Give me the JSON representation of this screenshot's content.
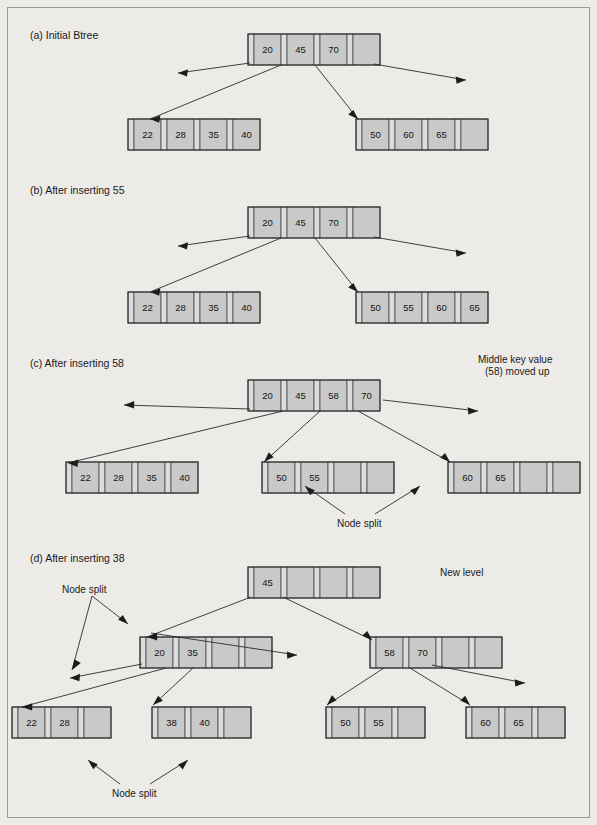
{
  "figure": {
    "title_label": "",
    "background_color": "#edebe8",
    "node_fill_color": "#c9c9c9",
    "pointer_fill_color": "#dcdcdc",
    "line_color": "#2b2b2b"
  },
  "panels": [
    {
      "id": "a",
      "label": "(a) Initial Btree",
      "root": {
        "keys": [
          "20",
          "45",
          "70"
        ],
        "capacity": 4
      },
      "leaves": [
        {
          "keys": [
            "22",
            "28",
            "35",
            "40"
          ],
          "capacity": 4
        },
        {
          "keys": [
            "50",
            "60",
            "65"
          ],
          "capacity": 4
        }
      ],
      "annotations": []
    },
    {
      "id": "b",
      "label": "(b) After inserting 55",
      "root": {
        "keys": [
          "20",
          "45",
          "70"
        ],
        "capacity": 4
      },
      "leaves": [
        {
          "keys": [
            "22",
            "28",
            "35",
            "40"
          ],
          "capacity": 4
        },
        {
          "keys": [
            "50",
            "55",
            "60",
            "65"
          ],
          "capacity": 4
        }
      ],
      "annotations": []
    },
    {
      "id": "c",
      "label": "(c) After inserting 58",
      "root": {
        "keys": [
          "20",
          "45",
          "58",
          "70"
        ],
        "capacity": 4
      },
      "leaves": [
        {
          "keys": [
            "22",
            "28",
            "35",
            "40"
          ],
          "capacity": 4
        },
        {
          "keys": [
            "50",
            "55"
          ],
          "capacity": 4
        },
        {
          "keys": [
            "60",
            "65"
          ],
          "capacity": 4
        }
      ],
      "annotations": [
        {
          "name": "middle-key-note",
          "lines": [
            "Middle key value",
            "(58) moved up"
          ]
        },
        {
          "name": "node-split-note",
          "lines": [
            "Node split"
          ]
        }
      ]
    },
    {
      "id": "d",
      "label": "(d) After inserting 38",
      "root": {
        "keys": [
          "45"
        ],
        "capacity": 4
      },
      "internal": [
        {
          "keys": [
            "20",
            "35"
          ],
          "capacity": 4
        },
        {
          "keys": [
            "58",
            "70"
          ],
          "capacity": 4
        }
      ],
      "leaves": [
        {
          "keys": [
            "22",
            "28"
          ],
          "capacity": 3
        },
        {
          "keys": [
            "38",
            "40"
          ],
          "capacity": 3
        },
        {
          "keys": [
            "50",
            "55"
          ],
          "capacity": 3
        },
        {
          "keys": [
            "60",
            "65"
          ],
          "capacity": 3
        }
      ],
      "annotations": [
        {
          "name": "node-split-note-upper",
          "lines": [
            "Node split"
          ]
        },
        {
          "name": "new-level-note",
          "lines": [
            "New level"
          ]
        },
        {
          "name": "node-split-note-lower",
          "lines": [
            "Node split"
          ]
        }
      ]
    }
  ],
  "text": {
    "panel_a_label": "(a) Initial Btree",
    "panel_b_label": "(b) After inserting 55",
    "panel_c_label": "(c) After inserting 58",
    "panel_d_label": "(d) After inserting 38",
    "middle_key_line1": "Middle key value",
    "middle_key_line2": "(58) moved up",
    "node_split_c": "Node split",
    "node_split_d_upper": "Node split",
    "node_split_d_lower": "Node split",
    "new_level": "New level"
  }
}
